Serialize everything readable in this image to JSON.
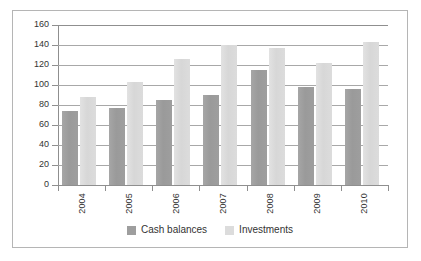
{
  "chart_data": {
    "type": "bar",
    "title": "",
    "xlabel": "",
    "ylabel": "",
    "ylim": [
      0,
      160
    ],
    "ytick_step": 20,
    "yticks": [
      "160",
      "140",
      "120",
      "100",
      "80",
      "60",
      "40",
      "20",
      "0"
    ],
    "grid": true,
    "legend_position": "bottom",
    "categories": [
      "2004",
      "2005",
      "2006",
      "2007",
      "2008",
      "2009",
      "2010"
    ],
    "series": [
      {
        "name": "Cash balances",
        "color": "#9e9e9e",
        "values": [
          74,
          77,
          85,
          90,
          115,
          98,
          96
        ]
      },
      {
        "name": "Investments",
        "color": "#dcdcdc",
        "values": [
          88,
          103,
          126,
          140,
          137,
          122,
          143
        ]
      }
    ]
  },
  "colors": {
    "border": "#b5b5b5",
    "gridline": "#a8a8a8",
    "axis": "#8f8f8f",
    "text": "#333333",
    "background": "#ffffff"
  }
}
